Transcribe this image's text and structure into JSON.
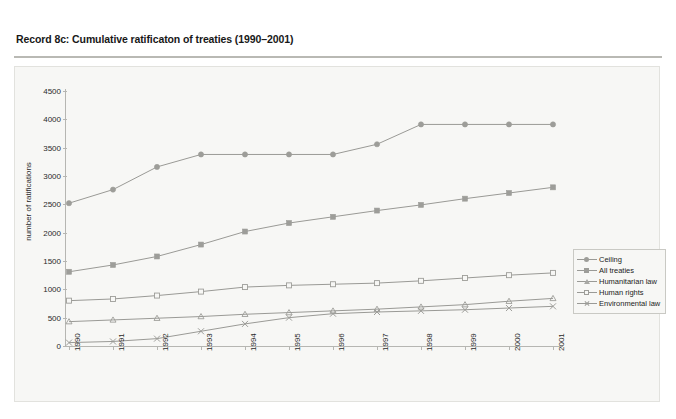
{
  "header": {
    "title": "Record 8c: Cumulative ratificaton of treaties (1990–2001)"
  },
  "legend": {
    "position": "right",
    "items": [
      {
        "label": "Ceiling",
        "marker": "circle"
      },
      {
        "label": "All treaties",
        "marker": "filled-square"
      },
      {
        "label": "Humanitarian law",
        "marker": "triangle"
      },
      {
        "label": "Human rights",
        "marker": "open-square"
      },
      {
        "label": "Environmental law",
        "marker": "cross"
      }
    ]
  },
  "colors": {
    "line": "#9a9a96",
    "marker": "#9d9d99",
    "axis": "#b6b6b2",
    "panel_bg": "#f7f7f5",
    "page_bg": "#ffffff",
    "text": "#2a2a2a",
    "title_rule": "#b9b9b4"
  },
  "chart_data": {
    "type": "line",
    "title": "Record 8c: Cumulative ratificaton of treaties (1990–2001)",
    "xlabel": "",
    "ylabel": "number of ratifications",
    "x": [
      "1990",
      "1991",
      "1992",
      "1993",
      "1994",
      "1995",
      "1996",
      "1997",
      "1998",
      "1999",
      "2000",
      "2001"
    ],
    "xtick_labels": [
      "1990",
      "1991",
      "1992",
      "1993",
      "1994",
      "1995",
      "1996",
      "1997",
      "1998",
      "1999",
      "2000",
      "2001"
    ],
    "ytick_labels": [
      "0",
      "500",
      "1000",
      "1500",
      "2000",
      "2500",
      "3000",
      "3500",
      "4000",
      "4500"
    ],
    "ytick_values": [
      0,
      500,
      1000,
      1500,
      2000,
      2500,
      3000,
      3500,
      4000,
      4500
    ],
    "ylim": [
      0,
      4500
    ],
    "grid": false,
    "legend_position": "right",
    "series": [
      {
        "name": "Ceiling",
        "marker": "circle",
        "values": [
          2520,
          2760,
          3160,
          3380,
          3380,
          3380,
          3380,
          3560,
          3910,
          3910,
          3910,
          3910
        ]
      },
      {
        "name": "All treaties",
        "marker": "filled-square",
        "values": [
          1310,
          1430,
          1580,
          1790,
          2020,
          2170,
          2280,
          2390,
          2490,
          2600,
          2700,
          2800
        ]
      },
      {
        "name": "Humanitarian law",
        "marker": "triangle",
        "values": [
          430,
          460,
          490,
          520,
          560,
          590,
          620,
          650,
          690,
          730,
          790,
          840
        ]
      },
      {
        "name": "Human rights",
        "marker": "open-square",
        "values": [
          800,
          830,
          890,
          960,
          1040,
          1070,
          1090,
          1110,
          1150,
          1200,
          1250,
          1290
        ]
      },
      {
        "name": "Environmental law",
        "marker": "cross",
        "values": [
          60,
          80,
          130,
          260,
          390,
          500,
          570,
          600,
          620,
          640,
          670,
          700
        ]
      }
    ]
  }
}
